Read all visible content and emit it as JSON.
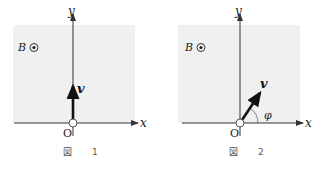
{
  "figures": [
    {
      "id": "fig1",
      "caption_symbol": "図",
      "caption_number": "1",
      "field_label": "B",
      "field_symbol": "⊙",
      "x_axis_label": "x",
      "y_axis_label": "y",
      "origin_label": "O",
      "velocity_label": "v",
      "velocity_direction": "+y"
    },
    {
      "id": "fig2",
      "caption_symbol": "図",
      "caption_number": "2",
      "field_label": "B",
      "field_symbol": "⊙",
      "x_axis_label": "x",
      "y_axis_label": "y",
      "origin_label": "O",
      "velocity_label": "v",
      "angle_label": "φ",
      "velocity_direction": "angle φ from +x axis"
    }
  ],
  "colors": {
    "region_fill": "#f0f0f0",
    "axis": "#333333",
    "arrow": "#111111"
  }
}
